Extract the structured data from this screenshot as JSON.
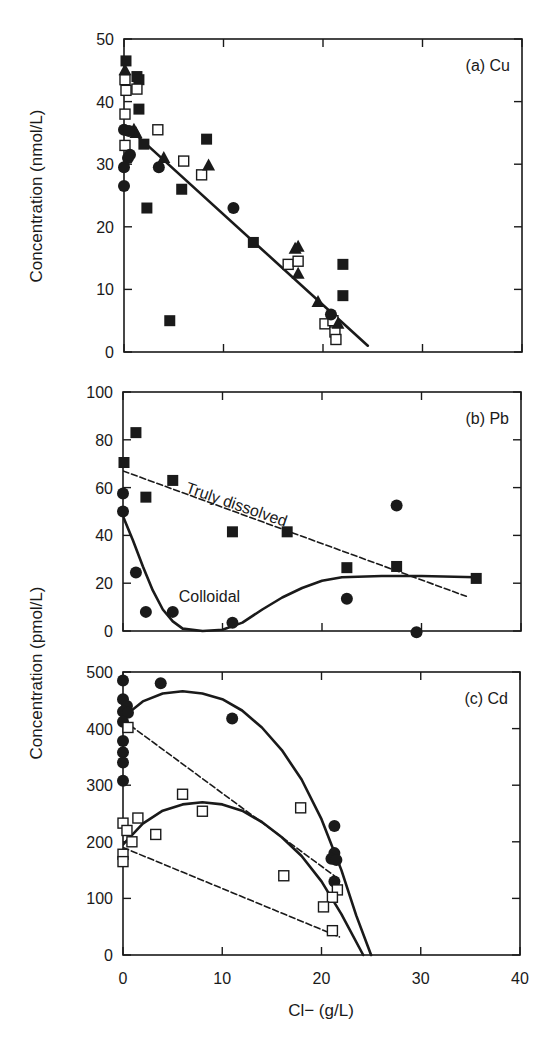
{
  "chart_data": [
    {
      "id": "a",
      "type": "scatter",
      "label": "(a) Cu",
      "ylabel": "Concentration (nmol/L)",
      "xlabel": "Cl− (g/L)",
      "xlim": [
        0,
        40
      ],
      "ylim": [
        0,
        50
      ],
      "yticks": [
        0,
        10,
        20,
        30,
        40,
        50
      ],
      "xticks": [
        0,
        10,
        20,
        30,
        40
      ],
      "box": {
        "x0": 124,
        "y0": 39,
        "x1": 522,
        "y1": 352
      },
      "series": [
        {
          "name": "filled squares",
          "marker": "square-filled",
          "points": [
            [
              0.2,
              46.5
            ],
            [
              1.3,
              44
            ],
            [
              1.5,
              43.5
            ],
            [
              1.5,
              38.8
            ],
            [
              2,
              33.2
            ],
            [
              2.3,
              23
            ],
            [
              5.8,
              26
            ],
            [
              8.3,
              34
            ],
            [
              13,
              17.5
            ],
            [
              22,
              14
            ],
            [
              22,
              9
            ],
            [
              4.6,
              5
            ]
          ]
        },
        {
          "name": "open squares",
          "marker": "square-open",
          "points": [
            [
              0.1,
              43.5
            ],
            [
              0.2,
              41.8
            ],
            [
              1.3,
              42
            ],
            [
              0.1,
              38
            ],
            [
              0.1,
              33
            ],
            [
              3.4,
              35.5
            ],
            [
              6,
              30.5
            ],
            [
              7.8,
              28.3
            ],
            [
              16.5,
              14
            ],
            [
              17.5,
              14.5
            ],
            [
              20.2,
              4.5
            ],
            [
              21,
              5
            ],
            [
              21.2,
              3.2
            ],
            [
              21.3,
              2
            ]
          ]
        },
        {
          "name": "filled triangles",
          "marker": "triangle-filled",
          "points": [
            [
              0.1,
              45
            ],
            [
              1,
              35.5
            ],
            [
              1.2,
              35
            ],
            [
              4,
              31
            ],
            [
              8.5,
              29.8
            ],
            [
              17.2,
              16.5
            ],
            [
              17.5,
              16.8
            ],
            [
              17.5,
              12.5
            ],
            [
              19.5,
              8
            ],
            [
              21.5,
              4.5
            ]
          ]
        },
        {
          "name": "filled circles",
          "marker": "circle-filled",
          "points": [
            [
              0,
              35.5
            ],
            [
              0.5,
              35.3
            ],
            [
              0.4,
              31
            ],
            [
              0.6,
              31.5
            ],
            [
              0,
              29.5
            ],
            [
              0,
              26.5
            ],
            [
              3.5,
              29.5
            ],
            [
              11,
              23
            ],
            [
              20.8,
              6
            ]
          ]
        }
      ],
      "lines": [
        {
          "name": "Cu fit",
          "style": "solid",
          "points": [
            [
              0.3,
              36
            ],
            [
              24.5,
              1
            ]
          ]
        }
      ]
    },
    {
      "id": "b",
      "type": "scatter",
      "label": "(b) Pb",
      "ylabel": "Concentration (pmol/L)",
      "xlim": [
        0,
        40
      ],
      "ylim": [
        0,
        100
      ],
      "yticks": [
        0,
        20,
        40,
        60,
        80,
        100
      ],
      "xticks": [
        0,
        10,
        20,
        30,
        40
      ],
      "box": {
        "x0": 123,
        "y0": 392,
        "x1": 521,
        "y1": 631
      },
      "annotations": [
        {
          "text": "Truly dissolved",
          "x": 6.2,
          "y": 58,
          "rotate": 19
        },
        {
          "text": "Colloidal",
          "x": 5.6,
          "y": 12,
          "rotate": 0
        }
      ],
      "series": [
        {
          "name": "Truly dissolved",
          "marker": "square-filled",
          "points": [
            [
              0.1,
              70.5
            ],
            [
              1.3,
              83
            ],
            [
              2.3,
              56
            ],
            [
              5,
              63
            ],
            [
              11,
              41.5
            ],
            [
              16.5,
              41.5
            ],
            [
              22.5,
              26.5
            ],
            [
              27.5,
              27
            ],
            [
              35.5,
              22
            ]
          ]
        },
        {
          "name": "Colloidal",
          "marker": "circle-filled",
          "points": [
            [
              0,
              57.5
            ],
            [
              0,
              50
            ],
            [
              1.3,
              24.5
            ],
            [
              2.3,
              8
            ],
            [
              5,
              8
            ],
            [
              11,
              3.5
            ],
            [
              22.5,
              13.5
            ],
            [
              27.5,
              52.5
            ],
            [
              29.5,
              -0.5
            ]
          ]
        }
      ],
      "lines": [
        {
          "name": "Truly dissolved fit",
          "style": "dashed",
          "points": [
            [
              0,
              67
            ],
            [
              34.5,
              14.5
            ]
          ]
        },
        {
          "name": "Colloidal fit",
          "style": "solid",
          "points": [
            [
              0,
              48
            ],
            [
              1,
              38
            ],
            [
              2,
              27
            ],
            [
              3,
              17
            ],
            [
              4,
              9
            ],
            [
              5,
              4
            ],
            [
              6,
              1
            ],
            [
              8,
              0
            ],
            [
              10,
              0.5
            ],
            [
              12,
              3.5
            ],
            [
              14,
              9
            ],
            [
              16,
              14
            ],
            [
              18,
              18
            ],
            [
              20,
              21
            ],
            [
              22,
              22.5
            ],
            [
              26,
              23
            ],
            [
              30,
              23
            ],
            [
              35.5,
              22.5
            ]
          ]
        }
      ]
    },
    {
      "id": "c",
      "type": "scatter",
      "label": "(c) Cd",
      "xlabel": "Cl− (g/L)",
      "xlim": [
        0,
        40
      ],
      "ylim": [
        0,
        500
      ],
      "yticks": [
        0,
        100,
        200,
        300,
        400,
        500
      ],
      "xticks": [
        0,
        10,
        20,
        30,
        40
      ],
      "box": {
        "x0": 123,
        "y0": 672,
        "x1": 520,
        "y1": 955
      },
      "series": [
        {
          "name": "filled circles",
          "marker": "circle-filled",
          "points": [
            [
              0,
              485
            ],
            [
              3.8,
              480
            ],
            [
              0,
              452
            ],
            [
              0.4,
              440
            ],
            [
              0,
              430
            ],
            [
              0.5,
              428
            ],
            [
              0,
              412
            ],
            [
              11,
              418
            ],
            [
              0,
              378
            ],
            [
              0,
              358
            ],
            [
              0,
              340
            ],
            [
              0,
              308
            ],
            [
              21.3,
              228
            ],
            [
              21.3,
              180
            ],
            [
              21,
              170
            ],
            [
              21.5,
              168
            ],
            [
              21.3,
              130
            ]
          ]
        },
        {
          "name": "open squares",
          "marker": "square-open",
          "points": [
            [
              0.5,
              402
            ],
            [
              0,
              233
            ],
            [
              0.4,
              220
            ],
            [
              1.5,
              242
            ],
            [
              6,
              284
            ],
            [
              3.3,
              213
            ],
            [
              8,
              254
            ],
            [
              0.9,
              200
            ],
            [
              0,
              178
            ],
            [
              0,
              165
            ],
            [
              17.9,
              260
            ],
            [
              16.2,
              140
            ],
            [
              21.6,
              115
            ],
            [
              21.1,
              102
            ],
            [
              20.2,
              85
            ],
            [
              21.1,
              43
            ]
          ]
        }
      ],
      "lines": [
        {
          "name": "circles curve",
          "style": "solid",
          "points": [
            [
              0,
              420
            ],
            [
              2,
              448
            ],
            [
              4,
              462
            ],
            [
              6,
              466
            ],
            [
              8,
              462
            ],
            [
              10,
              452
            ],
            [
              12,
              432
            ],
            [
              14,
              402
            ],
            [
              16,
              362
            ],
            [
              18,
              310
            ],
            [
              20,
              240
            ],
            [
              22,
              150
            ],
            [
              23.5,
              70
            ],
            [
              25,
              0
            ]
          ]
        },
        {
          "name": "squares curve",
          "style": "solid",
          "points": [
            [
              0,
              195
            ],
            [
              2,
              232
            ],
            [
              4,
              255
            ],
            [
              6,
              266
            ],
            [
              8,
              270
            ],
            [
              10,
              266
            ],
            [
              12,
              255
            ],
            [
              14,
              235
            ],
            [
              16,
              208
            ],
            [
              18,
              175
            ],
            [
              20,
              130
            ],
            [
              22,
              72
            ],
            [
              24.2,
              0
            ]
          ]
        },
        {
          "name": "circles dashed",
          "style": "dashed",
          "points": [
            [
              0,
              415
            ],
            [
              21.3,
              140
            ]
          ]
        },
        {
          "name": "squares dashed",
          "style": "dashed",
          "points": [
            [
              0,
              190
            ],
            [
              21.8,
              32
            ]
          ]
        }
      ]
    }
  ],
  "figure": {
    "panel_a_ylabel": "Concentration (nmol/L)",
    "panel_bc_ylabel": "Concentration (pmol/L)",
    "xlabel": "Cl− (g/L)"
  }
}
